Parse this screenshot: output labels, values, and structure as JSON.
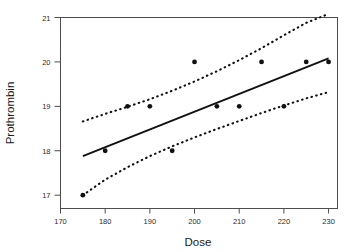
{
  "chart_data": {
    "type": "scatter",
    "title": "",
    "xlabel": "Dose",
    "ylabel": "Prothrombin",
    "xlim": [
      170.0,
      232.0
    ],
    "ylim": [
      16.7,
      21.0
    ],
    "xticks": [
      170,
      180,
      190,
      200,
      210,
      220,
      230
    ],
    "yticks": [
      17,
      18,
      19,
      20,
      21
    ],
    "grid": false,
    "legend": "none",
    "series": [
      {
        "name": "observations",
        "type": "scatter",
        "marker": "filled-circle",
        "color": "#111111",
        "points": [
          {
            "x": 175,
            "y": 17
          },
          {
            "x": 180,
            "y": 18
          },
          {
            "x": 185,
            "y": 19
          },
          {
            "x": 190,
            "y": 19
          },
          {
            "x": 195,
            "y": 18
          },
          {
            "x": 200,
            "y": 20
          },
          {
            "x": 205,
            "y": 19
          },
          {
            "x": 210,
            "y": 19
          },
          {
            "x": 215,
            "y": 20
          },
          {
            "x": 220,
            "y": 19
          },
          {
            "x": 225,
            "y": 20
          },
          {
            "x": 230,
            "y": 20
          }
        ]
      },
      {
        "name": "regression-line",
        "type": "line",
        "style": "solid",
        "color": "#111111",
        "x": [
          175,
          230
        ],
        "y": [
          17.88,
          20.08
        ]
      },
      {
        "name": "upper-confidence-band",
        "type": "line",
        "style": "dotted",
        "color": "#111111",
        "x": [
          175,
          180,
          185,
          190,
          195,
          200,
          205,
          210,
          215,
          220,
          225,
          230
        ],
        "y": [
          18.66,
          18.83,
          18.99,
          19.16,
          19.35,
          19.56,
          19.79,
          20.04,
          20.31,
          20.6,
          20.88,
          21.08
        ]
      },
      {
        "name": "lower-confidence-band",
        "type": "line",
        "style": "dotted",
        "color": "#111111",
        "x": [
          175,
          180,
          185,
          190,
          195,
          200,
          205,
          210,
          215,
          220,
          225,
          230
        ],
        "y": [
          17.0,
          17.35,
          17.63,
          17.88,
          18.1,
          18.3,
          18.49,
          18.67,
          18.85,
          19.02,
          19.18,
          19.32
        ]
      }
    ],
    "axis_box": {
      "x0": 170.0,
      "x1": 232.0,
      "y0": 16.7,
      "y1": 21.0
    }
  },
  "labels": {
    "xaxis_title": "Dose",
    "yaxis_title": "Prothrombin",
    "xtick_0": "170",
    "xtick_1": "180",
    "xtick_2": "190",
    "xtick_3": "200",
    "xtick_4": "210",
    "xtick_5": "220",
    "xtick_6": "230",
    "ytick_0": "17",
    "ytick_1": "18",
    "ytick_2": "19",
    "ytick_3": "20",
    "ytick_4": "21"
  },
  "colors": {
    "ink": "#111111",
    "axis": "#4d4d4d",
    "background": "#ffffff"
  }
}
